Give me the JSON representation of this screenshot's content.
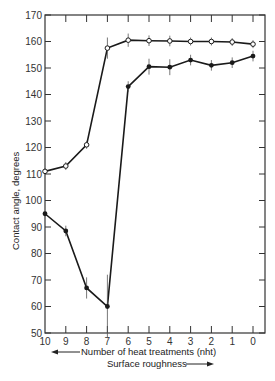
{
  "chart_data": {
    "type": "line",
    "title": "",
    "xlabel": "Number of heat treatments (nht)",
    "xlabel_secondary": "Surface roughness",
    "ylabel": "Contact angle, degrees",
    "x": [
      10,
      9,
      8,
      7,
      6,
      5,
      4,
      3,
      2,
      1,
      0
    ],
    "x_tick_labels": [
      "10",
      "9",
      "8",
      "7",
      "6",
      "5",
      "4",
      "3",
      "2",
      "1",
      "0"
    ],
    "y_tick_labels": [
      "50",
      "60",
      "70",
      "80",
      "90",
      "100",
      "110",
      "120",
      "130",
      "140",
      "150",
      "160",
      "170"
    ],
    "ylim": [
      50,
      170
    ],
    "xlim": [
      10,
      0
    ],
    "x_reversed": true,
    "grid": false,
    "legend": null,
    "series": [
      {
        "name": "Advancing (open circles)",
        "marker": "open-circle",
        "values": [
          111,
          113,
          121,
          157.5,
          160.5,
          160.3,
          160.2,
          160,
          160,
          159.8,
          159
        ],
        "error": [
          1,
          1.5,
          1.5,
          4,
          2.5,
          2,
          2,
          1.5,
          1.5,
          1.5,
          1.5
        ]
      },
      {
        "name": "Receding (filled circles)",
        "marker": "filled-circle",
        "values": [
          95,
          88.5,
          67,
          60,
          143,
          150.5,
          150.3,
          153,
          151,
          152,
          154.5
        ],
        "error": [
          0.5,
          2,
          4,
          12,
          2,
          3,
          3,
          2,
          2,
          2,
          2
        ]
      }
    ],
    "annotations": [
      {
        "text": "Number of heat treatments (nht)",
        "arrow": "left"
      },
      {
        "text": "Surface roughness",
        "arrow": "right"
      }
    ]
  },
  "labels": {
    "ylabel": "Contact angle, degrees",
    "xlabel": "Number of heat treatments (nht)",
    "xlabel2": "Surface roughness"
  }
}
